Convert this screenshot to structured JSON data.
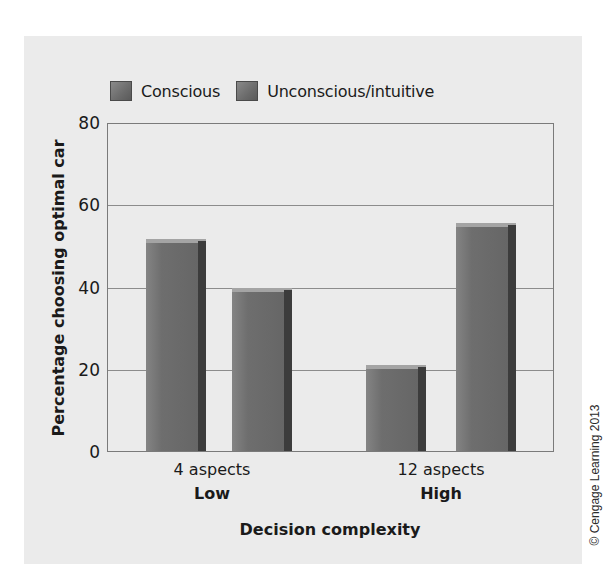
{
  "chart_data": {
    "type": "bar",
    "title": "",
    "xlabel": "Decision complexity",
    "ylabel": "Percentage choosing optimal car",
    "ylim": [
      0,
      80
    ],
    "yticks": [
      0,
      20,
      40,
      60,
      80
    ],
    "grid": true,
    "legend_position": "top",
    "categories": [
      "4 aspects",
      "12 aspects"
    ],
    "category_groups": [
      "Low",
      "High"
    ],
    "series": [
      {
        "name": "Conscious",
        "values": [
          52,
          21
        ]
      },
      {
        "name": "Unconscious/intuitive",
        "values": [
          40,
          56
        ]
      }
    ]
  },
  "legend": {
    "items": [
      {
        "label": "Conscious"
      },
      {
        "label": "Unconscious/intuitive"
      }
    ]
  },
  "axis": {
    "y_ticks": [
      "0",
      "20",
      "40",
      "60",
      "80"
    ],
    "x_ticks": [
      "4 aspects",
      "12 aspects"
    ],
    "x_groups": [
      "Low",
      "High"
    ],
    "x_label": "Decision complexity",
    "y_label": "Percentage choosing optimal car"
  },
  "credit": "© Cengage Learning 2013",
  "colors": {
    "panel_bg": "#ebebeb",
    "bar_front": "#6e6e6e",
    "bar_side": "#3c3c3c",
    "gridline": "#8c8c8c"
  }
}
